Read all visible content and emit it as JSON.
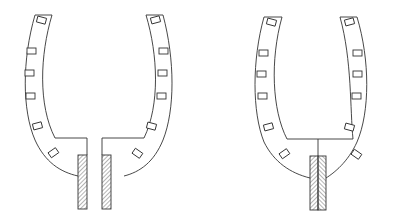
{
  "diagram": {
    "type": "technical-line-drawing",
    "stroke_color": "#333333",
    "background": "#ffffff",
    "figures": [
      {
        "id": "left",
        "variant": "split-base",
        "slot_count": 12,
        "post_count": 2,
        "post_hatch": "diagonal"
      },
      {
        "id": "right",
        "variant": "center-post",
        "slot_count": 12,
        "post_count": 1,
        "post_hatch": "herringbone"
      }
    ]
  }
}
